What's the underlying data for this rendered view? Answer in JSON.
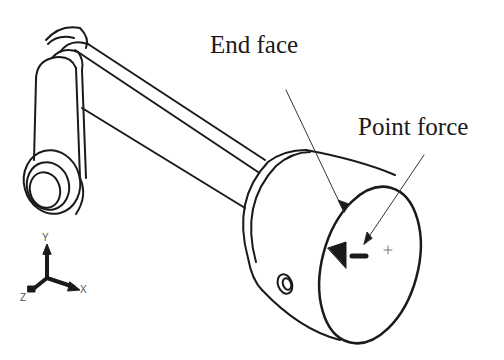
{
  "figure": {
    "labels": {
      "end_face": "End face",
      "point_force": "Point force"
    },
    "axes": {
      "x": "X",
      "y": "Y",
      "z": "Z"
    },
    "colors": {
      "line": "#1a1a1a",
      "background": "#ffffff",
      "leader": "#333333"
    }
  }
}
